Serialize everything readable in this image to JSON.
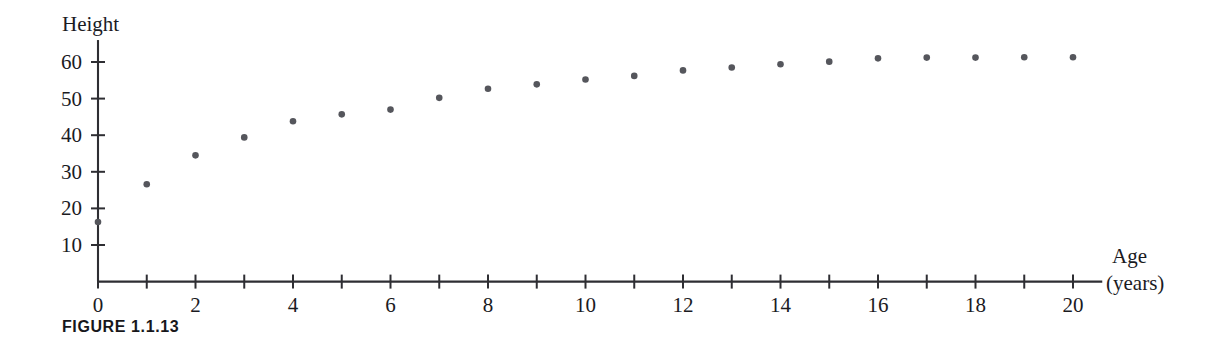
{
  "figure": {
    "caption": "FIGURE 1.1.13"
  },
  "chart_data": {
    "type": "scatter",
    "title": "",
    "subtitle": "",
    "ylabel": "Height",
    "xlabel_line1": "Age",
    "xlabel_line2": "(years)",
    "grid": false,
    "legend": false,
    "point_color": "#55565c",
    "axis_color": "#2e2e33",
    "xlim": [
      0,
      20.6
    ],
    "ylim": [
      0,
      66
    ],
    "x_tick_values": [
      0,
      1,
      2,
      3,
      4,
      5,
      6,
      7,
      8,
      9,
      10,
      11,
      12,
      13,
      14,
      15,
      16,
      17,
      18,
      19,
      20
    ],
    "x_tick_labels": [
      {
        "value": 0,
        "label": "0"
      },
      {
        "value": 2,
        "label": "2"
      },
      {
        "value": 4,
        "label": "4"
      },
      {
        "value": 6,
        "label": "6"
      },
      {
        "value": 8,
        "label": "8"
      },
      {
        "value": 10,
        "label": "10"
      },
      {
        "value": 12,
        "label": "12"
      },
      {
        "value": 14,
        "label": "14"
      },
      {
        "value": 16,
        "label": "16"
      },
      {
        "value": 18,
        "label": "18"
      },
      {
        "value": 20,
        "label": "20"
      }
    ],
    "y_tick_values": [
      10,
      20,
      30,
      40,
      50,
      60
    ],
    "y_tick_labels": [
      {
        "value": 10,
        "label": "10"
      },
      {
        "value": 20,
        "label": "20"
      },
      {
        "value": 30,
        "label": "30"
      },
      {
        "value": 40,
        "label": "40"
      },
      {
        "value": 50,
        "label": "50"
      },
      {
        "value": 60,
        "label": "60"
      }
    ],
    "x": [
      0,
      1,
      2,
      3,
      4,
      5,
      6,
      7,
      8,
      9,
      10,
      11,
      12,
      13,
      14,
      15,
      16,
      17,
      18,
      19,
      20
    ],
    "y": [
      16.3,
      26.6,
      34.5,
      39.4,
      43.8,
      45.7,
      47.0,
      50.2,
      52.7,
      53.9,
      55.2,
      56.2,
      57.7,
      58.5,
      59.4,
      60.1,
      61.0,
      61.2,
      61.2,
      61.3,
      61.3
    ],
    "points": [
      {
        "age": 0,
        "height": 16.3
      },
      {
        "age": 1,
        "height": 26.6
      },
      {
        "age": 2,
        "height": 34.5
      },
      {
        "age": 3,
        "height": 39.4
      },
      {
        "age": 4,
        "height": 43.8
      },
      {
        "age": 5,
        "height": 45.7
      },
      {
        "age": 6,
        "height": 47.0
      },
      {
        "age": 7,
        "height": 50.2
      },
      {
        "age": 8,
        "height": 52.7
      },
      {
        "age": 9,
        "height": 53.9
      },
      {
        "age": 10,
        "height": 55.2
      },
      {
        "age": 11,
        "height": 56.2
      },
      {
        "age": 12,
        "height": 57.7
      },
      {
        "age": 13,
        "height": 58.5
      },
      {
        "age": 14,
        "height": 59.4
      },
      {
        "age": 15,
        "height": 60.1
      },
      {
        "age": 16,
        "height": 61.0
      },
      {
        "age": 17,
        "height": 61.2
      },
      {
        "age": 18,
        "height": 61.2
      },
      {
        "age": 19,
        "height": 61.3
      },
      {
        "age": 20,
        "height": 61.3
      }
    ]
  }
}
